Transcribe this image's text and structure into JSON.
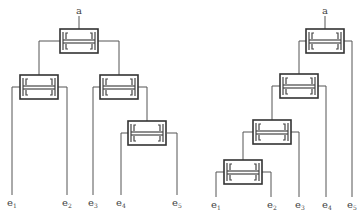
{
  "diagram": {
    "type": "tree-comparison",
    "left_tree": {
      "root_label": "a",
      "leaves": [
        {
          "base": "e",
          "sub": "1"
        },
        {
          "base": "e",
          "sub": "2"
        },
        {
          "base": "e",
          "sub": "3"
        },
        {
          "base": "e",
          "sub": "4"
        },
        {
          "base": "e",
          "sub": "5"
        }
      ],
      "structure": "balanced: root -> (node(e1,e2), node(e3, node(e4,e5)))"
    },
    "right_tree": {
      "root_label": "a",
      "leaves": [
        {
          "base": "e",
          "sub": "1"
        },
        {
          "base": "e",
          "sub": "2"
        },
        {
          "base": "e",
          "sub": "3"
        },
        {
          "base": "e",
          "sub": "4"
        },
        {
          "base": "e",
          "sub": "5"
        }
      ],
      "structure": "chain: root -> (node(node(node(e1,e2),e3),e4), e5)"
    },
    "colors": {
      "line": "#555555",
      "box": "#333333",
      "background": "#ffffff"
    }
  }
}
